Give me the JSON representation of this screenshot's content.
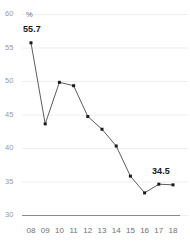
{
  "chart_data": {
    "type": "line",
    "title": "",
    "subtitle": "",
    "xlabel": "",
    "ylabel": "",
    "unit_label": "%",
    "categories": [
      "08",
      "09",
      "10",
      "11",
      "12",
      "13",
      "14",
      "15",
      "16",
      "17",
      "18"
    ],
    "values": [
      55.7,
      43.6,
      49.8,
      49.3,
      44.7,
      42.8,
      40.3,
      35.8,
      33.3,
      34.6,
      34.5
    ],
    "ylim": [
      30,
      60
    ],
    "yticks": [
      60,
      55,
      50,
      45,
      40,
      35,
      30
    ],
    "ytick_labels": [
      "60",
      "55",
      "50",
      "45",
      "40",
      "35",
      "30"
    ],
    "grid": true,
    "legend": false,
    "annotations": [
      {
        "category": "08",
        "value": 55.7,
        "text": "55.7"
      },
      {
        "category": "18",
        "value": 34.5,
        "text": "34.5"
      }
    ],
    "colors": {
      "line": "#4a4a4a",
      "marker": "#1a1a1a",
      "grid": "#eeeeee",
      "axis": "#8a8a8a",
      "ytick_text": "#9a9a9a",
      "xtick_text": "#6f6f6f",
      "label_text": "#1a1a1a",
      "background": "#ffffff"
    }
  }
}
